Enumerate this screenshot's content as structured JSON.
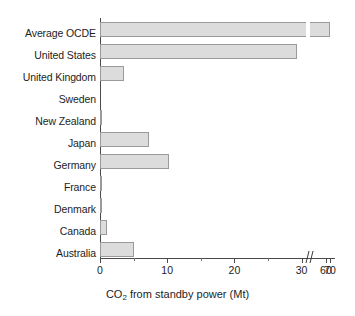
{
  "chart_data": {
    "type": "bar",
    "orientation": "horizontal",
    "title": "",
    "xlabel": "CO2 from standby power (Mt)",
    "xlabel_parts": {
      "prefix": "CO",
      "sub": "2",
      "suffix": " from standby power (Mt)"
    },
    "ylabel": "",
    "categories": [
      "Average OCDE",
      "United States",
      "United Kingdom",
      "Sweden",
      "New Zealand",
      "Japan",
      "Germany",
      "France",
      "Denmark",
      "Canada",
      "Australia"
    ],
    "values": [
      70,
      29.3,
      3.5,
      0,
      0.15,
      7.3,
      10.2,
      0.3,
      0.25,
      1.0,
      5.0
    ],
    "xlim": [
      0,
      70
    ],
    "xticks": [
      0,
      10,
      20,
      30,
      60,
      70
    ],
    "xtick_labels": [
      "0",
      "10",
      "20",
      "30",
      "60",
      "70"
    ],
    "minor_xticks": [
      5,
      15,
      25
    ],
    "axis_break": {
      "after": 30,
      "before": 60,
      "present": true
    },
    "grid": false,
    "legend": null,
    "bar_fill": "#dcdcdc",
    "bar_edge": "#9a9a9a",
    "axis_color": "#4a4a4a"
  }
}
